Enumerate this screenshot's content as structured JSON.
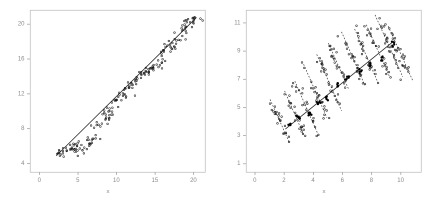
{
  "figure": {
    "width": 432,
    "height": 206,
    "background": "#ffffff",
    "frame_color": "#b9b9b9",
    "tick_color": "#9a9a9a",
    "label_color": "#8a8a8a",
    "marker_open_color": "#1a1a1a",
    "marker_filled_color": "#000000",
    "line_color": "#2b2b2b",
    "dashed_line_color": "#3a3a3a"
  },
  "chart_data": [
    {
      "id": "left-panel",
      "type": "scatter",
      "title": "",
      "xlabel": "x",
      "ylabel": "",
      "xlim": [
        -1.2,
        21.5
      ],
      "ylim": [
        3.0,
        21.6
      ],
      "xticks": [
        0,
        5,
        10,
        15,
        20
      ],
      "yticks": [
        4,
        8,
        12,
        16,
        20
      ],
      "xticklabels": [
        "0",
        "5",
        "10",
        "15",
        "20"
      ],
      "yticklabels": [
        "4",
        "8",
        "12",
        "16",
        "20"
      ],
      "grid": false,
      "legend": false,
      "plot_box": {
        "left": 30,
        "top": 10,
        "right": 205,
        "bottom": 172
      },
      "fit_lines": [
        {
          "style": "solid",
          "x": [
            2.2,
            20.4
          ],
          "y": [
            4.85,
            20.75
          ],
          "width": 0.8
        }
      ],
      "cluster_centers_x": [
        2.6,
        3.2,
        4.0,
        4.7,
        5.2,
        5.8,
        6.4,
        7.0,
        7.6,
        8.2,
        8.8,
        9.4,
        10.0,
        10.6,
        11.2,
        11.8,
        12.5,
        13.1,
        13.7,
        14.3,
        14.9,
        15.5,
        16.1,
        16.7,
        17.3,
        17.9,
        18.5,
        19.1,
        19.6,
        20.1
      ],
      "cluster_centers_y": [
        5.0,
        5.3,
        5.6,
        5.6,
        5.4,
        6.0,
        6.4,
        6.5,
        8.3,
        9.0,
        9.6,
        10.2,
        11.2,
        11.9,
        12.4,
        12.9,
        13.6,
        14.0,
        14.5,
        14.8,
        15.1,
        15.6,
        16.3,
        17.2,
        17.5,
        18.4,
        19.2,
        19.8,
        20.2,
        20.6
      ],
      "cluster_spread_x": 0.42,
      "cluster_spread_y": 0.33,
      "points_per_cluster": 7,
      "marker": "open-circle",
      "marker_size": 1.7,
      "n_points": 210
    },
    {
      "id": "right-panel",
      "type": "scatter",
      "title": "",
      "xlabel": "x",
      "ylabel": "",
      "xlim": [
        -0.6,
        11.4
      ],
      "ylim": [
        0.4,
        11.9
      ],
      "xticks": [
        0,
        2,
        4,
        6,
        8,
        10
      ],
      "yticks": [
        1,
        3,
        5,
        7,
        9,
        11
      ],
      "xticklabels": [
        "0",
        "2",
        "4",
        "6",
        "8",
        "10"
      ],
      "yticklabels": [
        "1",
        "3",
        "5",
        "7",
        "9",
        "11"
      ],
      "grid": false,
      "legend": false,
      "plot_box": {
        "left": 30,
        "top": 10,
        "right": 205,
        "bottom": 172
      },
      "fit_lines": [
        {
          "style": "solid",
          "x": [
            2.1,
            9.6
          ],
          "y": [
            3.45,
            9.75
          ],
          "width": 0.8
        }
      ],
      "group_lines": [
        {
          "style": "dashed",
          "x": [
            1.05,
            2.35
          ],
          "y": [
            5.55,
            2.55
          ],
          "width": 0.7
        },
        {
          "style": "dashed",
          "x": [
            2.05,
            3.35
          ],
          "y": [
            6.15,
            3.05
          ],
          "width": 0.7
        },
        {
          "style": "dashed",
          "x": [
            2.75,
            4.35
          ],
          "y": [
            6.85,
            3.05
          ],
          "width": 0.7
        },
        {
          "style": "dashed",
          "x": [
            3.35,
            4.95
          ],
          "y": [
            8.05,
            4.25
          ],
          "width": 0.7
        },
        {
          "style": "dashed",
          "x": [
            4.25,
            5.95
          ],
          "y": [
            8.75,
            4.75
          ],
          "width": 0.7
        },
        {
          "style": "dashed",
          "x": [
            5.05,
            6.45
          ],
          "y": [
            9.55,
            6.25
          ],
          "width": 0.7
        },
        {
          "style": "dashed",
          "x": [
            5.95,
            7.55
          ],
          "y": [
            10.35,
            6.55
          ],
          "width": 0.7
        },
        {
          "style": "dashed",
          "x": [
            6.85,
            8.45
          ],
          "y": [
            10.55,
            6.75
          ],
          "width": 0.7
        },
        {
          "style": "dashed",
          "x": [
            7.65,
            9.25
          ],
          "y": [
            10.85,
            7.15
          ],
          "width": 0.7
        },
        {
          "style": "dashed",
          "x": [
            8.25,
            10.15
          ],
          "y": [
            11.55,
            7.15
          ],
          "width": 0.7
        },
        {
          "style": "dashed",
          "x": [
            9.15,
            10.85
          ],
          "y": [
            10.75,
            6.85
          ],
          "width": 0.7
        }
      ],
      "group_means": [
        {
          "x": 2.35,
          "y": 3.75
        },
        {
          "x": 2.95,
          "y": 4.25
        },
        {
          "x": 3.75,
          "y": 4.55
        },
        {
          "x": 4.35,
          "y": 5.35
        },
        {
          "x": 4.95,
          "y": 5.65
        },
        {
          "x": 5.65,
          "y": 6.55
        },
        {
          "x": 6.35,
          "y": 7.05
        },
        {
          "x": 7.25,
          "y": 7.55
        },
        {
          "x": 7.95,
          "y": 8.05
        },
        {
          "x": 8.75,
          "y": 8.45
        },
        {
          "x": 9.45,
          "y": 9.45
        }
      ],
      "marker": "open-circle",
      "marker_size": 1.7,
      "mean_marker": "filled-circle",
      "mean_marker_size": 2.3,
      "points_per_group": 22,
      "n_points": 242
    }
  ]
}
